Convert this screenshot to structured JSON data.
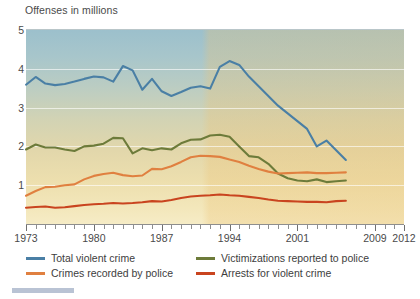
{
  "chart_data": {
    "type": "line",
    "title": "Offenses in millions",
    "xlabel": "",
    "ylabel": "Offenses in millions",
    "ylim": [
      0,
      5
    ],
    "xlim": [
      1973,
      2012
    ],
    "yticks": [
      5,
      4,
      3,
      2,
      1
    ],
    "xticks": [
      1973,
      1980,
      1987,
      1994,
      2001,
      2009,
      2012
    ],
    "grid": true,
    "legend_position": "bottom",
    "x": [
      1973,
      1974,
      1975,
      1976,
      1977,
      1978,
      1979,
      1980,
      1981,
      1982,
      1983,
      1984,
      1985,
      1986,
      1987,
      1988,
      1989,
      1990,
      1991,
      1992,
      1993,
      1994,
      1995,
      1996,
      1997,
      1998,
      1999,
      2000,
      2001,
      2002,
      2003,
      2004,
      2005,
      2006
    ],
    "series": [
      {
        "name": "Total violent crime",
        "color": "#4a7fa5",
        "values": [
          3.59,
          3.79,
          3.62,
          3.58,
          3.61,
          3.67,
          3.74,
          3.8,
          3.78,
          3.67,
          4.07,
          3.96,
          3.46,
          3.74,
          3.42,
          3.3,
          3.4,
          3.51,
          3.55,
          3.49,
          4.05,
          4.2,
          4.1,
          3.8,
          3.55,
          3.3,
          3.05,
          2.85,
          2.65,
          2.45,
          2.0,
          2.15,
          1.9,
          1.65
        ]
      },
      {
        "name": "Victimizations reported to police",
        "color": "#6d7b3a",
        "values": [
          1.92,
          2.05,
          1.97,
          1.97,
          1.92,
          1.88,
          2.0,
          2.02,
          2.07,
          2.22,
          2.21,
          1.82,
          1.95,
          1.9,
          1.95,
          1.92,
          2.08,
          2.17,
          2.18,
          2.28,
          2.3,
          2.25,
          2.0,
          1.75,
          1.72,
          1.55,
          1.3,
          1.18,
          1.12,
          1.1,
          1.15,
          1.08,
          1.1,
          1.12
        ]
      },
      {
        "name": "Crimes recorded by police",
        "color": "#e08040",
        "values": [
          0.73,
          0.85,
          0.95,
          0.96,
          1.0,
          1.02,
          1.15,
          1.24,
          1.29,
          1.32,
          1.26,
          1.23,
          1.25,
          1.42,
          1.41,
          1.49,
          1.6,
          1.72,
          1.76,
          1.75,
          1.73,
          1.66,
          1.6,
          1.5,
          1.42,
          1.35,
          1.3,
          1.31,
          1.32,
          1.33,
          1.31,
          1.31,
          1.32,
          1.33
        ]
      },
      {
        "name": "Arrests for violent crime",
        "color": "#c9441f",
        "values": [
          0.42,
          0.44,
          0.45,
          0.42,
          0.43,
          0.46,
          0.49,
          0.51,
          0.52,
          0.54,
          0.53,
          0.54,
          0.56,
          0.59,
          0.58,
          0.62,
          0.67,
          0.71,
          0.73,
          0.74,
          0.76,
          0.74,
          0.73,
          0.7,
          0.67,
          0.63,
          0.6,
          0.59,
          0.58,
          0.57,
          0.57,
          0.56,
          0.59,
          0.6
        ]
      }
    ]
  },
  "legend": {
    "items": [
      {
        "label": "Total violent crime",
        "color": "#4a7fa5"
      },
      {
        "label": "Victimizations reported to police",
        "color": "#6d7b3a"
      },
      {
        "label": "Crimes recorded by police",
        "color": "#e08040"
      },
      {
        "label": "Arrests for violent crime",
        "color": "#c9441f"
      }
    ]
  }
}
